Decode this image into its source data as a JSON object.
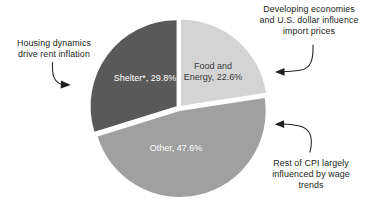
{
  "chart_data": {
    "type": "pie",
    "title": "",
    "subtitle": "",
    "xlabel": "",
    "ylabel": "",
    "grid": false,
    "legend_position": "none",
    "units": "percent",
    "start_angle_deg": 0,
    "direction": "clockwise",
    "exploded": true,
    "categories": [
      "Food and Energy",
      "Other",
      "Shelter*"
    ],
    "values": [
      22.6,
      47.6,
      29.8
    ],
    "slice_labels": [
      "Food and\nEnergy, 22.6%",
      "Other, 47.6%",
      "Shelter*, 29.8%"
    ],
    "colors": [
      "#d4d4d4",
      "#a0a0a0",
      "#595959"
    ],
    "label_colors": [
      "#3b3b3b",
      "#ffffff",
      "#ffffff"
    ],
    "slices": [
      {
        "name": "Food and Energy",
        "value": 22.6,
        "label": "Food and\nEnergy, 22.6%",
        "color": "#d4d4d4"
      },
      {
        "name": "Other",
        "value": 47.6,
        "label": "Other, 47.6%",
        "color": "#a0a0a0"
      },
      {
        "name": "Shelter*",
        "value": 29.8,
        "label": "Shelter*, 29.8%",
        "color": "#595959"
      }
    ],
    "annotations": [
      {
        "id": "housing",
        "text": "Housing dynamics\ndrive rent inflation",
        "target": "Shelter*"
      },
      {
        "id": "developing",
        "text": "Developing economies\nand U.S. dollar influence\nimport prices",
        "target": "Food and Energy"
      },
      {
        "id": "rest",
        "text": "Rest of CPI largely\ninfluenced by wage\ntrends",
        "target": "Other"
      }
    ]
  },
  "figure": {
    "background": "#ffffff",
    "annotation_color": "#231f20",
    "arrow_color": "#231f20",
    "gap_color": "#ffffff"
  }
}
